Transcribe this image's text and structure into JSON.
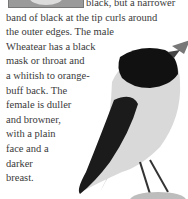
{
  "article": {
    "lines": [
      "black, but a narrower",
      "band of black at the tip curls around",
      "the outer edges. The male",
      "Wheatear has a black",
      "mask or throat and",
      "a whitish to orange-",
      "buff back. The",
      "female is duller",
      "and browner,",
      "with a plain",
      "face and a",
      "darker",
      "breast."
    ]
  },
  "image": {
    "subject": "wheatear-bird",
    "colors": {
      "mask": "#111111",
      "body": "#d8d8d8",
      "wing": "#1a1a1a",
      "perch": "#bdbdbd"
    }
  }
}
